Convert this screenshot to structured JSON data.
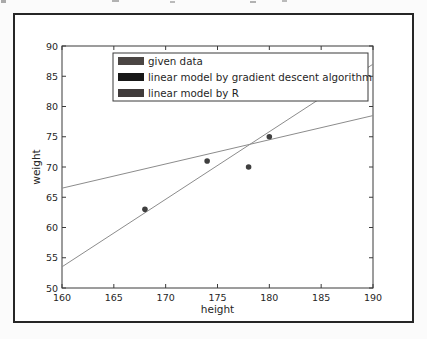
{
  "figure": {
    "background": "#ffffff",
    "outer_border_color": "#262626",
    "spine_color": "#3a3a3a",
    "text_color": "#262626"
  },
  "chart_data": {
    "type": "scatter",
    "title": "",
    "xlabel": "height",
    "ylabel": "weight",
    "xlim": [
      160,
      190
    ],
    "ylim": [
      50,
      90
    ],
    "x_ticks": [
      "160",
      "165",
      "170",
      "175",
      "180",
      "185",
      "190"
    ],
    "y_ticks": [
      "50",
      "55",
      "60",
      "65",
      "70",
      "75",
      "80",
      "85",
      "90"
    ],
    "grid": false,
    "tick_direction": "in",
    "legend": {
      "position": "upper-center-inside",
      "border_color": "#3a3a3a",
      "background": "#ffffff",
      "entries": [
        {
          "label": "given data",
          "swatch_color": "#4a4543",
          "kind": "scatter"
        },
        {
          "label": "linear model by gradient descent algorithm",
          "swatch_color": "#181818",
          "kind": "line"
        },
        {
          "label": "linear model by R",
          "swatch_color": "#403b3b",
          "kind": "line"
        }
      ]
    },
    "series": [
      {
        "name": "given data",
        "type": "scatter",
        "color": "#3f3f3f",
        "points": [
          [
            168,
            63
          ],
          [
            174,
            71
          ],
          [
            178,
            70
          ],
          [
            180,
            75
          ]
        ]
      },
      {
        "name": "linear model by gradient descent algorithm",
        "type": "line",
        "color": "#8c8c8c",
        "endpoints": [
          [
            160,
            53.5
          ],
          [
            190,
            87
          ]
        ]
      },
      {
        "name": "linear model by R",
        "type": "line",
        "color": "#8c8c8c",
        "endpoints": [
          [
            160,
            66.5
          ],
          [
            190,
            78.5
          ]
        ]
      }
    ]
  }
}
